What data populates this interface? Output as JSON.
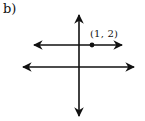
{
  "part_label": "b)",
  "point": {
    "label": "(1, 2)",
    "x": 1,
    "y": 2
  },
  "elements": {
    "vertical_axis": "y-axis with arrows at both ends",
    "horizontal_axis": "x-axis with arrows at both ends",
    "horizontal_line": "line y = 2 with arrows at both ends, passing through point (1, 2)"
  },
  "colors": {
    "ink": "#111111",
    "background": "#ffffff"
  }
}
